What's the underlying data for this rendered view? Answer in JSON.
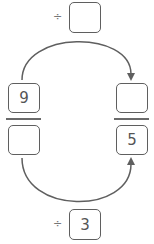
{
  "top_operator": {
    "symbol": "÷",
    "value": ""
  },
  "bottom_operator": {
    "symbol": "÷",
    "value": "3"
  },
  "left_fraction": {
    "numerator": "9",
    "denominator": ""
  },
  "right_fraction": {
    "numerator": "",
    "denominator": "5"
  },
  "colors": {
    "stroke": "#5f5f5f",
    "text": "#555555"
  }
}
